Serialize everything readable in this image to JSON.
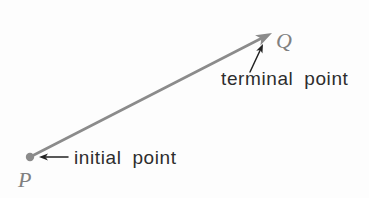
{
  "figure": {
    "labels": {
      "initial_point_label": "P",
      "terminal_point_label": "Q",
      "initial_annotation": "initial point",
      "terminal_annotation": "terminal point"
    },
    "colors": {
      "background": "#fdfdfd",
      "vector": "#8b8b8b",
      "point_label": "#808080",
      "annotation_text": "#2d2d2d",
      "callout_arrow": "#222222"
    }
  }
}
